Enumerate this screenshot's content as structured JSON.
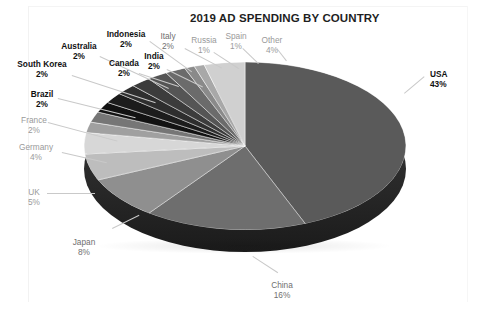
{
  "figure": {
    "title": "2019 AD SPENDING BY COUNTRY"
  },
  "chart_data": {
    "type": "pie",
    "title": "2019 AD SPENDING BY COUNTRY",
    "xlabel": "",
    "ylabel": "",
    "unit": "percent",
    "legend": "none (direct data labels with leader lines)",
    "three_d": true,
    "categories": [
      "USA",
      "China",
      "Japan",
      "UK",
      "Germany",
      "France",
      "Brazil",
      "South Korea",
      "Australia",
      "Indonesia",
      "Canada",
      "India",
      "Italy",
      "Russia",
      "Spain",
      "Other"
    ],
    "values": [
      43,
      16,
      8,
      5,
      4,
      2,
      2,
      2,
      2,
      2,
      2,
      2,
      2,
      1,
      1,
      4
    ],
    "labels": [
      {
        "name": "USA",
        "percent": "43%",
        "value": 43,
        "color": "#5a5a5a"
      },
      {
        "name": "China",
        "percent": "16%",
        "value": 16,
        "color": "#6e6e6e"
      },
      {
        "name": "Japan",
        "percent": "8%",
        "value": 8,
        "color": "#8f8f8f"
      },
      {
        "name": "UK",
        "percent": "5%",
        "value": 5,
        "color": "#bdbdbd"
      },
      {
        "name": "Germany",
        "percent": "4%",
        "value": 4,
        "color": "#d7d7d7"
      },
      {
        "name": "France",
        "percent": "2%",
        "value": 2,
        "color": "#a0a0a0"
      },
      {
        "name": "Brazil",
        "percent": "2%",
        "value": 2,
        "color": "#767676"
      },
      {
        "name": "South Korea",
        "percent": "2%",
        "value": 2,
        "color": "#121212"
      },
      {
        "name": "Australia",
        "percent": "2%",
        "value": 2,
        "color": "#1c1c1c"
      },
      {
        "name": "Indonesia",
        "percent": "2%",
        "value": 2,
        "color": "#2e2e2e"
      },
      {
        "name": "Canada",
        "percent": "2%",
        "value": 2,
        "color": "#3c3c3c"
      },
      {
        "name": "India",
        "percent": "2%",
        "value": 2,
        "color": "#555555"
      },
      {
        "name": "Italy",
        "percent": "2%",
        "value": 2,
        "color": "#6b6b6b"
      },
      {
        "name": "Russia",
        "percent": "1%",
        "value": 1,
        "color": "#8a8a8a"
      },
      {
        "name": "Spain",
        "percent": "1%",
        "value": 1,
        "color": "#a8a8a8"
      },
      {
        "name": "Other",
        "percent": "4%",
        "value": 4,
        "color": "#d0d0d0"
      }
    ]
  }
}
